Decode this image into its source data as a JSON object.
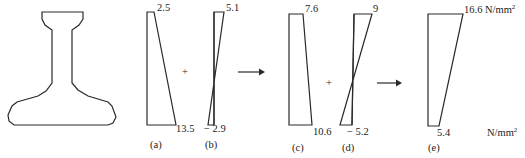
{
  "figure": {
    "unit": "N/mm",
    "unit_sup": "2",
    "operators": {
      "plus": "+",
      "arrow": "→"
    },
    "diagrams": [
      {
        "id": "a",
        "label": "(a)",
        "top": "2.5",
        "bottom": "13.5"
      },
      {
        "id": "b",
        "label": "(b)",
        "top": "5.1",
        "bottom": "− 2.9"
      },
      {
        "id": "c",
        "label": "(c)",
        "top": "7.6",
        "bottom": "10.6"
      },
      {
        "id": "d",
        "label": "(d)",
        "top": "9",
        "bottom": "− 5.2"
      },
      {
        "id": "e",
        "label": "(e)",
        "top": "16.6",
        "bottom": "5.4"
      }
    ]
  },
  "colors": {
    "line": "#2a2a2a",
    "background": "#ffffff"
  }
}
